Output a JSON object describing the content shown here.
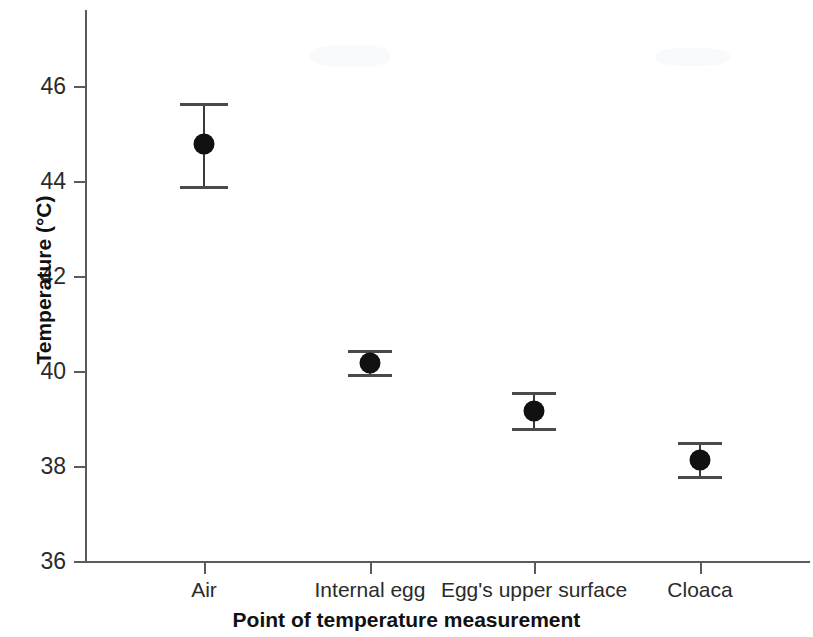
{
  "chart_data": {
    "type": "scatter",
    "title": "",
    "xlabel": "Point of temperature measurement",
    "ylabel": "Temperature (°C)",
    "categories": [
      "Air",
      "Internal egg",
      "Egg's upper surface",
      "Cloaca"
    ],
    "values": [
      44.8,
      40.18,
      39.17,
      38.15
    ],
    "error_upper": [
      45.65,
      40.44,
      39.55,
      38.5
    ],
    "error_lower": [
      43.9,
      39.93,
      38.8,
      37.78
    ],
    "error_bars": true,
    "ylim": [
      36,
      47.1
    ],
    "yticks": [
      36,
      38,
      40,
      42,
      44,
      46
    ],
    "ytick_labels": [
      "36",
      "38",
      "40",
      "42",
      "44",
      "46"
    ],
    "grid": false,
    "legend": null,
    "marker": "filled-circle",
    "marker_color": "#111111",
    "axis_color": "#5a5a5a",
    "background_color": "#ffffff",
    "series": [
      {
        "name": "Temperature",
        "points": [
          {
            "category": "Air",
            "value": 44.8,
            "upper": 45.65,
            "lower": 43.9
          },
          {
            "category": "Internal egg",
            "value": 40.18,
            "upper": 40.44,
            "lower": 39.93
          },
          {
            "category": "Egg's upper surface",
            "value": 39.17,
            "upper": 39.55,
            "lower": 38.8
          },
          {
            "category": "Cloaca",
            "value": 38.15,
            "upper": 38.5,
            "lower": 37.78
          }
        ]
      }
    ]
  }
}
